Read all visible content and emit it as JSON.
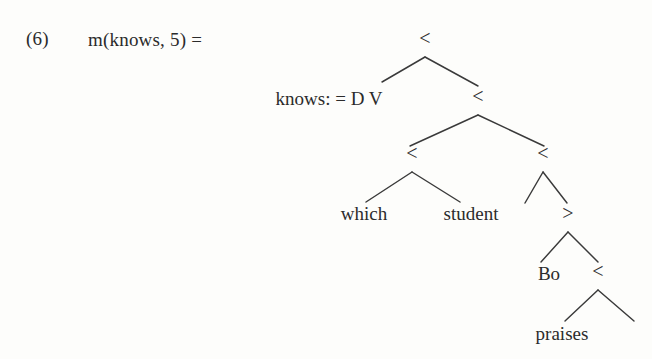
{
  "figure": {
    "equation_number": "(6)",
    "expression": "m(knows, 5) =",
    "text_color": "#2b2b2b",
    "background_color": "#fdfdfb",
    "branch_color": "#3a3a3a"
  },
  "tree": {
    "nodes": [
      {
        "id": "root",
        "label": "<",
        "kind": "op",
        "x": 425,
        "y": 45,
        "anchor": "middle"
      },
      {
        "id": "knows",
        "label": "knows: = D V",
        "kind": "feature",
        "x": 329,
        "y": 105,
        "anchor": "middle"
      },
      {
        "id": "n2",
        "label": "<",
        "kind": "op",
        "x": 478,
        "y": 103,
        "anchor": "middle"
      },
      {
        "id": "n3l",
        "label": "<",
        "kind": "op",
        "x": 412,
        "y": 160,
        "anchor": "middle"
      },
      {
        "id": "n3r",
        "label": "<",
        "kind": "op",
        "x": 543,
        "y": 160,
        "anchor": "middle"
      },
      {
        "id": "which",
        "label": "which",
        "kind": "word",
        "x": 364,
        "y": 220,
        "anchor": "middle"
      },
      {
        "id": "student",
        "label": "student",
        "kind": "word",
        "x": 471,
        "y": 220,
        "anchor": "middle"
      },
      {
        "id": "empty1",
        "label": "",
        "kind": "word",
        "x": 524,
        "y": 220,
        "anchor": "middle"
      },
      {
        "id": "gt",
        "label": ">",
        "kind": "op",
        "x": 568,
        "y": 220,
        "anchor": "middle"
      },
      {
        "id": "bo",
        "label": "Bo",
        "kind": "word",
        "x": 549,
        "y": 280,
        "anchor": "middle"
      },
      {
        "id": "n5",
        "label": "<",
        "kind": "op",
        "x": 598,
        "y": 278,
        "anchor": "middle"
      },
      {
        "id": "praises",
        "label": "praises",
        "kind": "word",
        "x": 562,
        "y": 340,
        "anchor": "middle"
      },
      {
        "id": "empty2",
        "label": "",
        "kind": "word",
        "x": 636,
        "y": 340,
        "anchor": "middle"
      }
    ],
    "branches": [
      {
        "id": "root-left",
        "from": [
          425,
          57
        ],
        "to": [
          382,
          82
        ]
      },
      {
        "id": "root-right",
        "from": [
          425,
          57
        ],
        "to": [
          478,
          86
        ]
      },
      {
        "id": "n2-left",
        "from": [
          478,
          115
        ],
        "to": [
          410,
          146
        ]
      },
      {
        "id": "n2-right",
        "from": [
          478,
          115
        ],
        "to": [
          544,
          146
        ]
      },
      {
        "id": "n3l-left",
        "from": [
          412,
          172
        ],
        "to": [
          366,
          202
        ]
      },
      {
        "id": "n3l-right",
        "from": [
          412,
          172
        ],
        "to": [
          460,
          202
        ]
      },
      {
        "id": "n3r-left",
        "from": [
          543,
          172
        ],
        "to": [
          525,
          203
        ]
      },
      {
        "id": "n3r-right",
        "from": [
          543,
          172
        ],
        "to": [
          567,
          203
        ]
      },
      {
        "id": "gt-left",
        "from": [
          568,
          232
        ],
        "to": [
          541,
          262
        ]
      },
      {
        "id": "gt-right",
        "from": [
          568,
          232
        ],
        "to": [
          598,
          262
        ]
      },
      {
        "id": "n5-left",
        "from": [
          598,
          290
        ],
        "to": [
          565,
          321
        ]
      },
      {
        "id": "n5-right",
        "from": [
          598,
          290
        ],
        "to": [
          634,
          321
        ]
      }
    ]
  }
}
